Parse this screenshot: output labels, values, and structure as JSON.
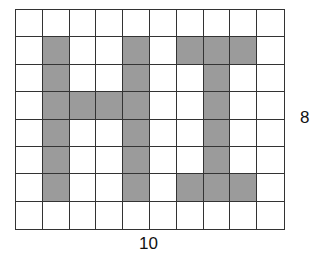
{
  "figure": {
    "rows": 8,
    "cols": 10,
    "fill_color": "#9b9b9b",
    "line_color": "#333333",
    "filled_cells": [
      [
        1,
        1
      ],
      [
        1,
        4
      ],
      [
        1,
        6
      ],
      [
        1,
        7
      ],
      [
        1,
        8
      ],
      [
        2,
        1
      ],
      [
        2,
        4
      ],
      [
        2,
        7
      ],
      [
        3,
        1
      ],
      [
        3,
        2
      ],
      [
        3,
        3
      ],
      [
        3,
        4
      ],
      [
        3,
        7
      ],
      [
        4,
        1
      ],
      [
        4,
        4
      ],
      [
        4,
        7
      ],
      [
        5,
        1
      ],
      [
        5,
        4
      ],
      [
        5,
        7
      ],
      [
        6,
        1
      ],
      [
        6,
        4
      ],
      [
        6,
        6
      ],
      [
        6,
        7
      ],
      [
        6,
        8
      ]
    ],
    "height_label": "8",
    "width_label": "10"
  }
}
